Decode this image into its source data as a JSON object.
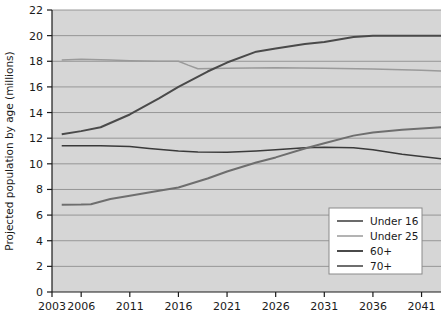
{
  "chart_data": {
    "type": "line",
    "title": "",
    "xlabel": "",
    "ylabel": "Projected population by age (millions)",
    "xlim": [
      2003,
      2043
    ],
    "ylim": [
      0,
      22
    ],
    "y_ticks": [
      0,
      2,
      4,
      6,
      8,
      10,
      12,
      14,
      16,
      18,
      20,
      22
    ],
    "x_ticks": [
      2003,
      2006,
      2011,
      2016,
      2021,
      2026,
      2031,
      2036,
      2041
    ],
    "x_tick_labels": [
      "2003",
      "2006",
      "2011",
      "2016",
      "2021",
      "2026",
      "2031",
      "2036",
      "2041"
    ],
    "y_tick_labels": [
      "0",
      "2",
      "4",
      "6",
      "8",
      "10",
      "12",
      "14",
      "16",
      "18",
      "20",
      "22"
    ],
    "grid": "horizontal",
    "plot_background": "#d6d6d6",
    "legend_position": "lower-right",
    "series": [
      {
        "name": "Under 16",
        "color": "#3a3a3a",
        "width": 1.5,
        "x": [
          2004,
          2006,
          2008,
          2011,
          2013,
          2016,
          2018,
          2021,
          2024,
          2026,
          2029,
          2031,
          2034,
          2036,
          2039,
          2043
        ],
        "values": [
          11.4,
          11.4,
          11.4,
          11.35,
          11.2,
          11.0,
          10.92,
          10.9,
          11.0,
          11.1,
          11.25,
          11.3,
          11.25,
          11.1,
          10.75,
          10.4
        ]
      },
      {
        "name": "Under 25",
        "color": "#9a9a9a",
        "width": 1.5,
        "x": [
          2004,
          2006,
          2009,
          2011,
          2014,
          2016,
          2017,
          2018,
          2021,
          2026,
          2031,
          2036,
          2041,
          2043
        ],
        "values": [
          18.1,
          18.15,
          18.1,
          18.05,
          18.0,
          18.0,
          17.7,
          17.42,
          17.45,
          17.5,
          17.45,
          17.4,
          17.3,
          17.25
        ]
      },
      {
        "name": "60+",
        "color": "#4a4a4a",
        "width": 2.0,
        "x": [
          2004,
          2006,
          2008,
          2011,
          2014,
          2016,
          2019,
          2021,
          2024,
          2026,
          2029,
          2031,
          2034,
          2036,
          2039,
          2043
        ],
        "values": [
          12.3,
          12.55,
          12.85,
          13.85,
          15.1,
          16.0,
          17.2,
          17.9,
          18.75,
          19.0,
          19.35,
          19.5,
          19.9,
          20.0,
          20.0,
          20.0
        ]
      },
      {
        "name": "70+",
        "color": "#6e6e6e",
        "width": 2.0,
        "x": [
          2004,
          2006,
          2007,
          2009,
          2011,
          2014,
          2016,
          2019,
          2021,
          2024,
          2026,
          2029,
          2031,
          2034,
          2036,
          2039,
          2043
        ],
        "values": [
          6.8,
          6.82,
          6.85,
          7.25,
          7.5,
          7.9,
          8.15,
          8.85,
          9.4,
          10.1,
          10.5,
          11.2,
          11.6,
          12.2,
          12.45,
          12.65,
          12.85
        ]
      }
    ],
    "legend_entries": [
      {
        "label": "Under 16",
        "color": "#3a3a3a",
        "width": 1.5
      },
      {
        "label": "Under 25",
        "color": "#9a9a9a",
        "width": 1.5
      },
      {
        "label": "60+",
        "color": "#4a4a4a",
        "width": 2.0
      },
      {
        "label": "70+",
        "color": "#6e6e6e",
        "width": 2.0
      }
    ]
  },
  "axes": {
    "y_axis_title": "Projected population by age (millions)"
  }
}
